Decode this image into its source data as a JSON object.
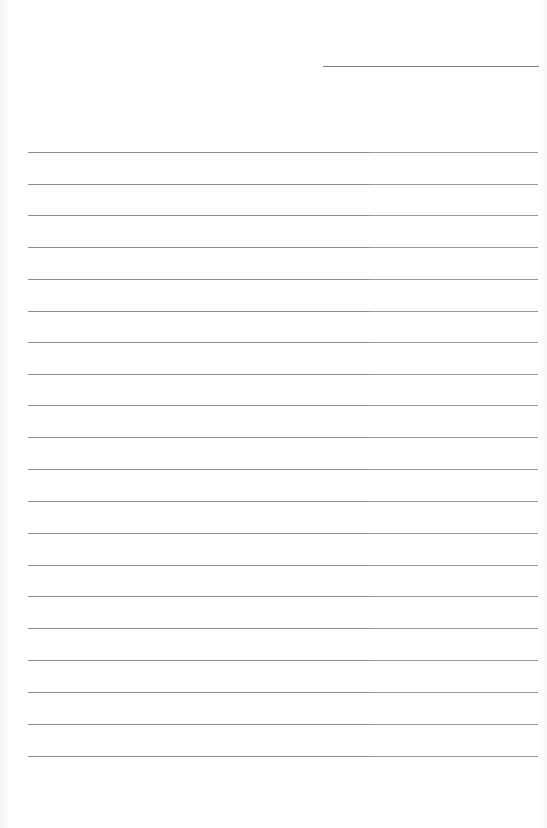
{
  "page": {
    "type": "blank lined writing sheet",
    "background_color": "#ffffff",
    "line_color": "#8c8c8c"
  },
  "header": {
    "date_line": {
      "value": "",
      "x": 323,
      "y": 66,
      "width": 216
    }
  },
  "ruled_lines": {
    "count": 20,
    "left": 28,
    "width": 510,
    "first_y": 152,
    "spacing": 31.7,
    "lines": [
      {
        "y": 152,
        "text": ""
      },
      {
        "y": 184,
        "text": ""
      },
      {
        "y": 215,
        "text": ""
      },
      {
        "y": 247,
        "text": ""
      },
      {
        "y": 279,
        "text": ""
      },
      {
        "y": 311,
        "text": ""
      },
      {
        "y": 342,
        "text": ""
      },
      {
        "y": 374,
        "text": ""
      },
      {
        "y": 405,
        "text": ""
      },
      {
        "y": 437,
        "text": ""
      },
      {
        "y": 469,
        "text": ""
      },
      {
        "y": 501,
        "text": ""
      },
      {
        "y": 533,
        "text": ""
      },
      {
        "y": 565,
        "text": ""
      },
      {
        "y": 596,
        "text": ""
      },
      {
        "y": 628,
        "text": ""
      },
      {
        "y": 660,
        "text": ""
      },
      {
        "y": 692,
        "text": ""
      },
      {
        "y": 724,
        "text": ""
      },
      {
        "y": 756,
        "text": ""
      }
    ]
  }
}
